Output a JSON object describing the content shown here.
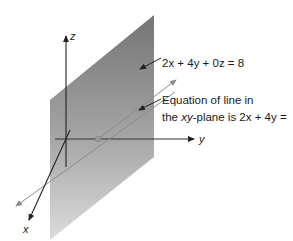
{
  "diagram": {
    "type": "3d-plane-illustration",
    "axes": {
      "x": {
        "label": "x"
      },
      "y": {
        "label": "y"
      },
      "z": {
        "label": "z"
      }
    },
    "plane": {
      "equation": "2x + 4y + 0z = 8",
      "fill_top": "#7a7a7a",
      "fill_bottom": "#d6d6d6"
    },
    "annotations": {
      "plane_label": "2x + 4y + 0z = 8",
      "line_label_line1": "Equation of line in",
      "line_label_line2_prefix": "the ",
      "line_label_line2_var": "xy",
      "line_label_line2_suffix": "-plane is 2x + 4y ="
    },
    "colors": {
      "axis": "#222222",
      "trace_line": "#8c8c8c",
      "intersection_dot": "#9a9a9a"
    }
  }
}
